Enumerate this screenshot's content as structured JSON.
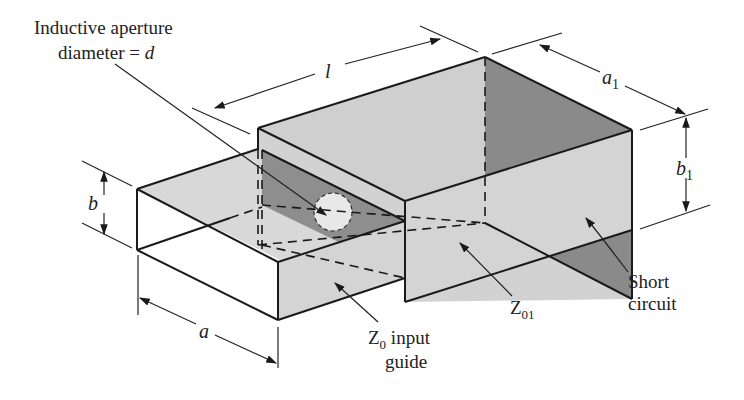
{
  "figure": {
    "labels": {
      "aperture_line1": "Inductive aperture",
      "aperture_line2": "diameter = ",
      "aperture_var": "d",
      "length": "l",
      "a1_main": "a",
      "a1_sub": "1",
      "b1_main": "b",
      "b1_sub": "1",
      "b": "b",
      "a": "a",
      "z0_main": "Z",
      "z0_sub": "0",
      "z0_rest": " input",
      "z0_line2": "guide",
      "z01_main": "Z",
      "z01_sub": "01",
      "short_line1": "Short",
      "short_line2": "circuit"
    },
    "colors": {
      "light_face": "#d9d9d9",
      "mid_face": "#c8c8c8",
      "dark_face": "#8c8c8c",
      "aperture": "#e6e6e6",
      "line": "#1a1a1a"
    }
  }
}
